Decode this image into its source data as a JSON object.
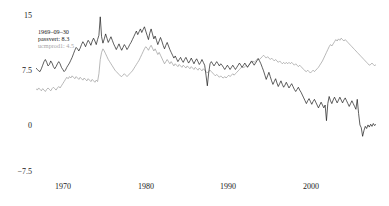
{
  "chart_data": {
    "type": "line",
    "title": "",
    "xlabel": "",
    "ylabel": "",
    "grid": false,
    "legend_position": "none",
    "xlim": [
      1967.0,
      2008.0
    ],
    "ylim": [
      -7.5,
      15
    ],
    "yticks": [
      15,
      7.5,
      0,
      -7.5
    ],
    "ytick_labels": [
      "15",
      "7.5",
      "0",
      "−7.5"
    ],
    "xticks": [
      1970,
      1980,
      1990,
      2000
    ],
    "xtick_labels": [
      "1970",
      "1980",
      "1990",
      "2000"
    ],
    "annotation": {
      "date": "1969–09–30",
      "series1_text": "passvert: 8.3",
      "series2_text": "ucmprod1: 4.5",
      "series1_value": 8.3,
      "series2_value": 4.5
    },
    "series": [
      {
        "name": "passvert",
        "color": "#1a1a1a",
        "values": [
          7.4,
          7.2,
          7.0,
          6.9,
          7.3,
          7.8,
          8.3,
          8.6,
          8.2,
          7.7,
          7.9,
          8.4,
          8.1,
          7.6,
          7.3,
          7.6,
          8.0,
          8.3,
          8.0,
          7.5,
          7.2,
          6.9,
          7.1,
          7.5,
          7.8,
          8.1,
          8.5,
          8.9,
          9.4,
          9.9,
          10.3,
          10.1,
          9.8,
          10.2,
          10.7,
          11.1,
          10.8,
          10.4,
          10.9,
          11.3,
          11.0,
          10.6,
          11.2,
          11.6,
          11.2,
          10.7,
          11.4,
          12.0,
          14.6,
          11.8,
          10.9,
          11.5,
          12.2,
          11.6,
          11.0,
          11.4,
          11.8,
          11.3,
          10.8,
          10.4,
          10.0,
          10.4,
          10.8,
          10.3,
          9.9,
          10.3,
          10.7,
          10.4,
          10.0,
          10.3,
          10.7,
          11.0,
          11.4,
          11.8,
          12.2,
          12.6,
          12.1,
          12.5,
          12.9,
          12.4,
          12.8,
          13.2,
          12.6,
          12.0,
          11.4,
          12.3,
          12.9,
          12.2,
          11.5,
          11.9,
          11.3,
          10.7,
          11.2,
          11.7,
          11.2,
          10.6,
          10.1,
          10.6,
          11.0,
          10.5,
          10.0,
          9.6,
          9.2,
          8.8,
          9.1,
          8.7,
          8.3,
          8.6,
          8.9,
          8.5,
          8.2,
          8.6,
          8.9,
          8.5,
          8.1,
          8.4,
          8.8,
          8.4,
          8.0,
          8.4,
          8.7,
          8.3,
          7.9,
          8.2,
          8.6,
          8.2,
          7.8,
          6.4,
          4.9,
          6.7,
          8.0,
          8.3,
          8.0,
          7.7,
          8.0,
          8.3,
          8.0,
          7.7,
          8.0,
          7.8,
          7.5,
          7.2,
          7.5,
          7.8,
          7.5,
          7.2,
          7.5,
          7.8,
          7.5,
          7.2,
          7.5,
          7.8,
          8.1,
          7.8,
          7.5,
          7.8,
          8.1,
          7.8,
          7.5,
          7.8,
          8.1,
          8.4,
          8.1,
          7.8,
          8.1,
          8.4,
          8.7,
          8.4,
          8.0,
          7.5,
          7.0,
          6.4,
          5.8,
          6.3,
          6.8,
          6.2,
          5.6,
          5.1,
          5.5,
          5.9,
          5.3,
          4.8,
          5.2,
          5.6,
          5.1,
          4.7,
          5.0,
          5.4,
          5.0,
          4.6,
          4.9,
          5.2,
          4.8,
          4.4,
          4.1,
          4.4,
          4.7,
          4.3,
          4.0,
          3.6,
          3.2,
          2.8,
          2.4,
          2.8,
          3.1,
          2.7,
          2.3,
          2.7,
          3.0,
          2.6,
          2.2,
          1.8,
          2.2,
          2.6,
          2.2,
          1.8,
          2.2,
          0.0,
          2.4,
          3.4,
          2.8,
          2.4,
          2.9,
          3.3,
          2.9,
          2.5,
          2.9,
          3.3,
          2.9,
          2.5,
          2.9,
          3.2,
          2.8,
          2.4,
          2.0,
          2.4,
          2.8,
          2.4,
          2.0,
          1.6,
          3.0,
          1.0,
          -0.6,
          -1.0,
          -2.2,
          -1.4,
          -0.8,
          -1.1,
          -0.6,
          -0.9,
          -0.5,
          -0.8,
          -0.4,
          -0.7,
          -0.5
        ]
      },
      {
        "name": "ucmprod1",
        "color": "#9a9a9a",
        "values": [
          4.5,
          4.3,
          4.6,
          4.4,
          4.2,
          4.5,
          4.3,
          4.1,
          4.4,
          4.6,
          4.4,
          4.2,
          4.5,
          4.7,
          4.5,
          4.3,
          4.6,
          4.8,
          4.6,
          4.9,
          5.2,
          5.5,
          5.8,
          6.1,
          5.9,
          6.2,
          6.0,
          6.3,
          6.1,
          5.9,
          6.2,
          6.0,
          5.8,
          6.1,
          5.9,
          5.7,
          6.0,
          5.8,
          5.6,
          5.9,
          5.7,
          5.5,
          5.8,
          5.6,
          5.4,
          5.7,
          5.5,
          6.6,
          8.6,
          9.6,
          10.1,
          9.8,
          9.4,
          9.0,
          8.6,
          8.3,
          8.0,
          7.7,
          7.4,
          7.1,
          6.9,
          6.7,
          6.5,
          6.3,
          6.2,
          6.4,
          6.6,
          6.4,
          6.2,
          6.4,
          6.6,
          6.8,
          7.0,
          7.3,
          7.6,
          7.9,
          8.2,
          8.5,
          8.9,
          9.3,
          9.7,
          10.1,
          10.4,
          10.2,
          9.9,
          10.3,
          10.6,
          10.2,
          9.8,
          10.1,
          9.7,
          9.3,
          9.6,
          9.2,
          8.8,
          8.4,
          8.0,
          8.3,
          8.6,
          8.3,
          8.0,
          8.3,
          8.0,
          7.7,
          8.0,
          7.8,
          7.6,
          7.9,
          7.7,
          7.5,
          7.8,
          7.6,
          7.4,
          7.7,
          7.5,
          7.3,
          7.6,
          7.4,
          7.2,
          7.5,
          7.3,
          7.1,
          7.4,
          7.2,
          7.0,
          7.3,
          7.1,
          6.9,
          6.7,
          6.9,
          7.1,
          6.9,
          6.7,
          6.5,
          6.3,
          6.5,
          6.3,
          6.1,
          6.3,
          6.1,
          6.0,
          6.2,
          6.0,
          6.2,
          6.4,
          6.2,
          6.4,
          6.6,
          6.4,
          6.6,
          6.8,
          7.0,
          7.2,
          7.4,
          7.6,
          7.4,
          7.6,
          7.8,
          7.6,
          7.8,
          8.0,
          8.2,
          8.4,
          8.2,
          8.4,
          8.6,
          8.8,
          8.6,
          8.8,
          9.0,
          9.2,
          9.0,
          8.8,
          9.0,
          8.8,
          8.6,
          8.8,
          8.6,
          8.4,
          8.6,
          8.4,
          8.2,
          8.4,
          8.2,
          8.0,
          8.2,
          8.0,
          8.2,
          8.0,
          8.2,
          8.0,
          8.2,
          8.0,
          7.8,
          8.0,
          7.8,
          7.6,
          7.8,
          7.6,
          7.4,
          7.2,
          7.0,
          6.9,
          7.1,
          6.9,
          6.7,
          6.9,
          7.1,
          6.9,
          7.1,
          7.3,
          7.5,
          7.8,
          8.1,
          8.4,
          8.8,
          9.2,
          9.6,
          10.0,
          10.4,
          10.7,
          10.5,
          10.8,
          11.1,
          11.4,
          11.2,
          11.5,
          11.3,
          11.6,
          11.4,
          11.2,
          11.4,
          11.2,
          11.0,
          10.8,
          10.6,
          10.4,
          10.2,
          10.0,
          9.8,
          9.6,
          9.4,
          9.2,
          9.0,
          8.8,
          8.6,
          8.4,
          8.2,
          8.0,
          7.8,
          7.9,
          8.1,
          7.9,
          7.7,
          7.9
        ]
      }
    ]
  },
  "axes": {
    "y_ticks": [
      {
        "label": "15",
        "value": 15
      },
      {
        "label": "7.5",
        "value": 7.5
      },
      {
        "label": "0",
        "value": 0
      },
      {
        "label": "−7.5",
        "value": -7.5
      }
    ],
    "x_ticks": [
      {
        "label": "1970",
        "value": 1970
      },
      {
        "label": "1980",
        "value": 1980
      },
      {
        "label": "1990",
        "value": 1990
      },
      {
        "label": "2000",
        "value": 2000
      }
    ]
  },
  "annotation": {
    "line1": "1969–09–30",
    "line2": "passvert: 8.3",
    "line3": "ucmprod1: 4.5"
  },
  "colors": {
    "series1": "#1a1a1a",
    "series2": "#9a9a9a",
    "text": "#1a1a1a",
    "muted_text": "#a6a6a6",
    "background": "#ffffff"
  }
}
